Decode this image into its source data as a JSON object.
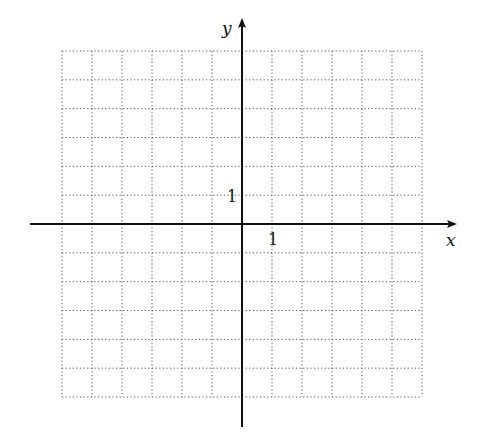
{
  "diagram": {
    "type": "coordinate-plane",
    "grid": {
      "columns": 12,
      "rows": 12,
      "x_range": [
        -6,
        6
      ],
      "y_range": [
        -6,
        6
      ],
      "line_style": "dotted",
      "line_color": "#555555"
    },
    "axes": {
      "x_label": "x",
      "y_label": "y",
      "color": "#111111"
    },
    "tick_labels": {
      "x_unit": "1",
      "y_unit": "1"
    }
  }
}
